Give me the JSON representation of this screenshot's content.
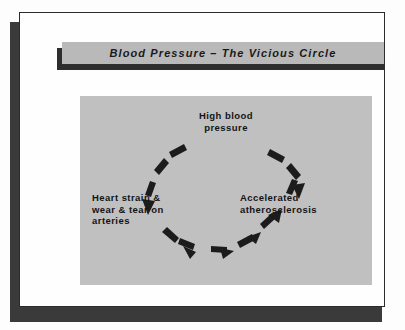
{
  "slide": {
    "title": "Blood Pressure – The Vicious Circle",
    "background_color": "#fefefe",
    "title_band_color": "#b9b9b9",
    "panel_color": "#c0c0c0",
    "text_color": "#141414",
    "arrow_color": "#1c1c1c"
  },
  "diagram": {
    "type": "cycle",
    "direction": "counter-clockwise",
    "nodes": [
      {
        "id": "high-blood-pressure",
        "position": "top",
        "lines": [
          "High blood",
          "pressure"
        ],
        "text": "High blood\npressure"
      },
      {
        "id": "heart-strain",
        "position": "left",
        "lines": [
          "Heart strain &",
          "wear & tear on",
          "arteries"
        ],
        "text": "Heart strain &\nwear & tear on\narteries"
      },
      {
        "id": "accelerated-atherosclerosis",
        "position": "right",
        "lines": [
          "Accelerated",
          "atherosclerosis"
        ],
        "text": "Accelerated\natherosclerosis"
      }
    ],
    "arrows": [
      {
        "id": "arrow-top-to-left",
        "from": "high-blood-pressure",
        "to": "heart-strain",
        "style": "dashed-arc",
        "segments": 3,
        "arrowhead": "end-down"
      },
      {
        "id": "arrow-left-to-right",
        "from": "heart-strain",
        "to": "accelerated-atherosclerosis",
        "style": "dashed-arc",
        "segments": 4,
        "arrowhead": "end-right"
      },
      {
        "id": "arrow-right-to-top",
        "from": "accelerated-atherosclerosis",
        "to": "high-blood-pressure",
        "style": "dashed-arc",
        "segments": 3,
        "arrowhead": "end-up"
      }
    ]
  }
}
